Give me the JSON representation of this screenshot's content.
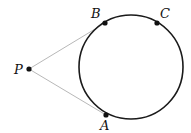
{
  "diagram": {
    "type": "circle-tangents",
    "colors": {
      "circle": "#1a1a1a",
      "tangent": "#b8b8b8",
      "point": "#111111"
    },
    "circle": {
      "cx": 131,
      "cy": 67,
      "r": 52
    },
    "points": {
      "P": {
        "label": "P",
        "x": 29,
        "y": 69
      },
      "A": {
        "label": "A",
        "x": 106,
        "y": 115
      },
      "B": {
        "label": "B",
        "x": 105,
        "y": 23
      },
      "C": {
        "label": "C",
        "x": 157,
        "y": 23
      }
    },
    "segments": [
      {
        "from": "P",
        "to": "B"
      },
      {
        "from": "P",
        "to": "A"
      }
    ]
  }
}
